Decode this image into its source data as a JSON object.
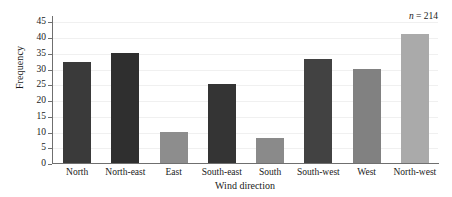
{
  "chart_data": {
    "type": "bar",
    "title": "",
    "xlabel": "Wind direction",
    "ylabel": "Frequency",
    "categories": [
      "North",
      "North-east",
      "East",
      "South-east",
      "South",
      "South-west",
      "West",
      "North-west"
    ],
    "values": [
      32,
      35,
      10,
      25,
      8,
      33,
      30,
      41
    ],
    "series": [
      {
        "name": "Frequency",
        "values": [
          32,
          35,
          10,
          25,
          8,
          33,
          30,
          41
        ]
      }
    ],
    "bar_colors": [
      "#3a3a3a",
      "#2f2f2f",
      "#8d8d8d",
      "#343434",
      "#8a8a8a",
      "#424242",
      "#818181",
      "#aaaaaa"
    ],
    "ylim": [
      0,
      47
    ],
    "yticks": [
      0,
      5,
      10,
      15,
      20,
      25,
      30,
      35,
      40,
      45
    ],
    "ytick_labels": [
      "0",
      "5",
      "10",
      "15",
      "20",
      "25",
      "30",
      "35",
      "40",
      "45"
    ],
    "grid": true,
    "grid_axis": "y",
    "legend": false,
    "legend_position": "none",
    "annotations": [
      {
        "name": "sample-size",
        "symbol": "n",
        "equals": " = ",
        "value": "214",
        "text": "n = 214",
        "position": "top-right"
      }
    ],
    "axis_color": "#6f6f6f",
    "gridline_color": "#f0f0f0",
    "background": "#ffffff"
  }
}
